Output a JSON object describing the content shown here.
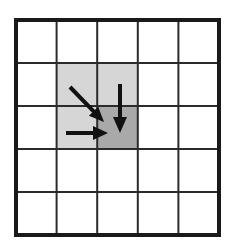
{
  "figure": {
    "title": "Grid neighborhood diagram",
    "description": "A 5 by 5 square grid with two shaded cells in the upper-middle region and three black arrows converging on the shared corner of the shaded cells.",
    "background_color": "#ffffff",
    "outer_border_color": "#1a1a1a",
    "grid_line_color": "#2b2b2b",
    "cell_fill_default": "#ffffff"
  },
  "grid": {
    "rows": 5,
    "columns": 5,
    "origin_x": 16,
    "origin_y": 20,
    "cell_width": 40.6,
    "cell_height": 43.0,
    "outer_border_width": 4,
    "inner_line_width": 2
  },
  "shaded_cells": [
    {
      "name": "cell-r2c2",
      "row": 2,
      "column": 2,
      "fill": "#d6d6d6",
      "shade": "light-gray"
    },
    {
      "name": "cell-r2c3",
      "row": 2,
      "column": 3,
      "fill": "#d6d6d6",
      "shade": "light-gray"
    },
    {
      "name": "cell-r3c2",
      "row": 3,
      "column": 2,
      "fill": "#d6d6d6",
      "shade": "light-gray"
    },
    {
      "name": "cell-r3c3",
      "row": 3,
      "column": 3,
      "fill": "#a9a9a9",
      "shade": "medium-gray"
    }
  ],
  "arrows": [
    {
      "name": "diagonal-arrow",
      "direction": "down-right",
      "color": "#111111",
      "x1": 70,
      "y1": 87,
      "x2": 104,
      "y2": 122,
      "stroke_width": 4,
      "head_length": 15,
      "head_width": 13
    },
    {
      "name": "vertical-arrow",
      "direction": "down",
      "color": "#111111",
      "x1": 120,
      "y1": 84,
      "x2": 120,
      "y2": 133,
      "stroke_width": 4,
      "head_length": 16,
      "head_width": 14
    },
    {
      "name": "horizontal-arrow",
      "direction": "right",
      "color": "#111111",
      "x1": 66,
      "y1": 133,
      "x2": 108,
      "y2": 133,
      "stroke_width": 4,
      "head_length": 15,
      "head_width": 14
    }
  ],
  "convergence_point": {
    "x": 107,
    "y": 128,
    "label": "shared corner of shaded cells"
  }
}
